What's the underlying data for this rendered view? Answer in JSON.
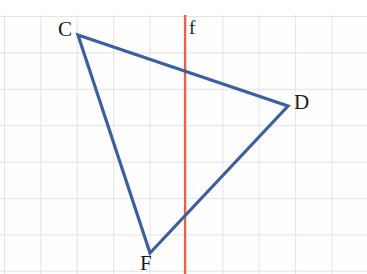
{
  "figure": {
    "width": 367,
    "height": 274,
    "background_color": "#fefefe",
    "grid": {
      "visible": true,
      "color": "#e3e3e3",
      "cell_size_px": 36.4,
      "origin_x": 4,
      "origin_y": 16
    },
    "shapes": {
      "triangle": {
        "name": "triangle-CDF",
        "stroke_color": "#3c5fa0",
        "stroke_width": 3,
        "fill": "none",
        "points": "78,35 288,106 150,253",
        "vertices": [
          {
            "label": "C",
            "x": 78,
            "y": 35
          },
          {
            "label": "D",
            "x": 288,
            "y": 106
          },
          {
            "label": "F",
            "x": 150,
            "y": 253
          }
        ]
      },
      "mirror_line": {
        "name": "line-f",
        "label": "f",
        "stroke_color": "#e8614a",
        "stroke_width": 2,
        "x": 185,
        "y1": 10,
        "y2": 274
      }
    },
    "labels": [
      {
        "name": "vertex-label-C",
        "text": "C",
        "x": 59,
        "y": 20
      },
      {
        "name": "vertex-label-D",
        "text": "D",
        "x": 294,
        "y": 93
      },
      {
        "name": "vertex-label-F",
        "text": "F",
        "x": 140,
        "y": 254
      },
      {
        "name": "line-label-f",
        "text": "f",
        "x": 189,
        "y": 18
      }
    ]
  }
}
